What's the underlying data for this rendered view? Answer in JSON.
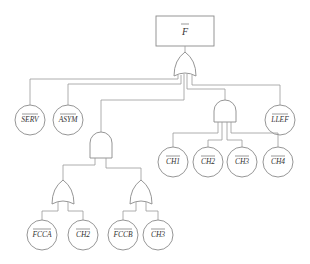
{
  "diagram": {
    "type": "fault-tree",
    "top_event": {
      "label": "F",
      "negated": true
    },
    "gates": [
      {
        "id": "or-top",
        "type": "OR",
        "inputs": [
          "SERV",
          "ASYM",
          "and-left",
          "and-right",
          "LLEF"
        ]
      },
      {
        "id": "and-left",
        "type": "AND",
        "inputs": [
          "or-a",
          "or-b"
        ]
      },
      {
        "id": "and-right",
        "type": "AND",
        "inputs": [
          "CH1",
          "CH2",
          "CH3",
          "CH4"
        ]
      },
      {
        "id": "or-a",
        "type": "OR",
        "inputs": [
          "FCCA",
          "CH2"
        ]
      },
      {
        "id": "or-b",
        "type": "OR",
        "inputs": [
          "FCCB",
          "CH3"
        ]
      }
    ],
    "events": {
      "serv": "SERV",
      "asym": "ASYM",
      "llef": "LLEF",
      "ch1": "CH1",
      "ch2": "CH2",
      "ch3": "CH3",
      "ch4": "CH4",
      "fcca": "FCCA",
      "ch2b": "CH2",
      "fccb": "FCCB",
      "ch3b": "CH3"
    },
    "colors": {
      "line": "#9a9a9a",
      "text": "#333333",
      "background": "#ffffff"
    }
  }
}
